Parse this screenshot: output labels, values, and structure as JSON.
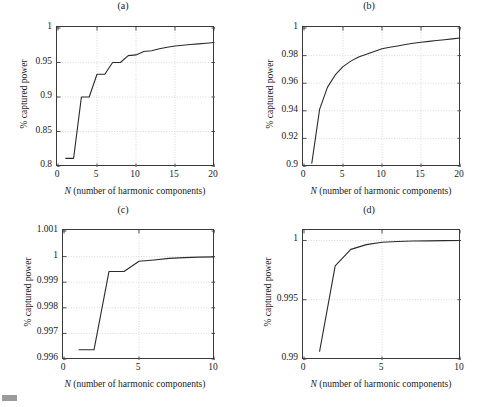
{
  "figure": {
    "width": 492,
    "height": 407,
    "background": "#ffffff",
    "line_color": "#2b2b2b",
    "axis_color": "#3a3a3a",
    "grid_color": "#cfcfcf"
  },
  "artifact": {
    "name": "gray-mark"
  },
  "panels": [
    {
      "id": "a",
      "title": "(a)",
      "xlabel_italic": "N",
      "xlabel_rest": " (number of harmonic components)",
      "ylabel": "% captured power",
      "xticks": [
        "0",
        "5",
        "10",
        "15",
        "20"
      ],
      "yticks": [
        "0.8",
        "0.85",
        "0.9",
        "0.95",
        "1"
      ]
    },
    {
      "id": "b",
      "title": "(b)",
      "xlabel_italic": "N",
      "xlabel_rest": " (number of harmonic components)",
      "ylabel": "% captured power",
      "xticks": [
        "0",
        "5",
        "10",
        "15",
        "20"
      ],
      "yticks": [
        "0.9",
        "0.92",
        "0.94",
        "0.96",
        "0.98",
        "1"
      ]
    },
    {
      "id": "c",
      "title": "(c)",
      "xlabel_italic": "N",
      "xlabel_rest": " (number of harmonic components)",
      "ylabel": "% captured power",
      "xticks": [
        "0",
        "5",
        "10"
      ],
      "yticks": [
        "0.996",
        "0.997",
        "0.998",
        "0.999",
        "1",
        "1.001"
      ]
    },
    {
      "id": "d",
      "title": "(d)",
      "xlabel_italic": "N",
      "xlabel_rest": " (number of harmonic components)",
      "ylabel": "% captured power",
      "xticks": [
        "0",
        "5",
        "10"
      ],
      "yticks": [
        "0.99",
        "0.995",
        "1"
      ]
    }
  ],
  "chart_data": [
    {
      "type": "line",
      "panel": "a",
      "title": "(a)",
      "xlabel": "N (number of harmonic components)",
      "ylabel": "% captured power",
      "xlim": [
        0,
        20
      ],
      "ylim": [
        0.8,
        1.0
      ],
      "xticks": [
        0,
        5,
        10,
        15,
        20
      ],
      "yticks": [
        0.8,
        0.85,
        0.9,
        0.95,
        1.0
      ],
      "grid": true,
      "legend": "none",
      "x": [
        1,
        2,
        3,
        4,
        5,
        6,
        7,
        8,
        9,
        10,
        11,
        12,
        13,
        14,
        15,
        16,
        17,
        18,
        19,
        20
      ],
      "values": [
        0.811,
        0.811,
        0.9,
        0.9,
        0.933,
        0.933,
        0.95,
        0.95,
        0.96,
        0.961,
        0.966,
        0.967,
        0.97,
        0.972,
        0.974,
        0.975,
        0.976,
        0.977,
        0.978,
        0.979
      ]
    },
    {
      "type": "line",
      "panel": "b",
      "title": "(b)",
      "xlabel": "N (number of harmonic components)",
      "ylabel": "% captured power",
      "xlim": [
        0,
        20
      ],
      "ylim": [
        0.9,
        1.0
      ],
      "xticks": [
        0,
        5,
        10,
        15,
        20
      ],
      "yticks": [
        0.9,
        0.92,
        0.94,
        0.96,
        0.98,
        1.0
      ],
      "grid": true,
      "legend": "none",
      "x": [
        1,
        2,
        3,
        4,
        5,
        6,
        7,
        8,
        9,
        10,
        11,
        12,
        13,
        14,
        15,
        16,
        17,
        18,
        19,
        20
      ],
      "values": [
        0.902,
        0.941,
        0.957,
        0.966,
        0.972,
        0.976,
        0.979,
        0.981,
        0.983,
        0.985,
        0.986,
        0.987,
        0.988,
        0.989,
        0.9897,
        0.9903,
        0.9909,
        0.9915,
        0.9921,
        0.9927
      ]
    },
    {
      "type": "line",
      "panel": "c",
      "title": "(c)",
      "xlabel": "N (number of harmonic components)",
      "ylabel": "% captured power",
      "xlim": [
        0,
        10
      ],
      "ylim": [
        0.996,
        1.001
      ],
      "xticks": [
        0,
        5,
        10
      ],
      "yticks": [
        0.996,
        0.997,
        0.998,
        0.999,
        1.0,
        1.001
      ],
      "grid": true,
      "legend": "none",
      "x": [
        1,
        2,
        3,
        4,
        5,
        6,
        7,
        8,
        9,
        10
      ],
      "values": [
        0.99636,
        0.99636,
        0.99942,
        0.99942,
        0.99982,
        0.99987,
        0.99993,
        0.99996,
        0.99998,
        0.99999
      ]
    },
    {
      "type": "line",
      "panel": "d",
      "title": "(d)",
      "xlabel": "N (number of harmonic components)",
      "ylabel": "% captured power",
      "xlim": [
        0,
        10
      ],
      "ylim": [
        0.99,
        1.0008
      ],
      "xticks": [
        0,
        5,
        10
      ],
      "yticks": [
        0.99,
        0.995,
        1.0
      ],
      "grid": true,
      "legend": "none",
      "x": [
        1,
        2,
        3,
        4,
        5,
        6,
        7,
        8,
        9,
        10
      ],
      "values": [
        0.99065,
        0.99785,
        0.99925,
        0.99965,
        0.99985,
        0.99991,
        0.99995,
        0.99997,
        0.99999,
        1.0
      ]
    }
  ]
}
